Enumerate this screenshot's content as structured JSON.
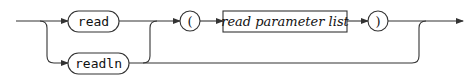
{
  "diagram": {
    "type": "syntax-diagram",
    "terminals": [
      {
        "id": "read",
        "label": "read"
      },
      {
        "id": "readln",
        "label": "readln"
      },
      {
        "id": "lparen",
        "label": "("
      },
      {
        "id": "rparen",
        "label": ")"
      }
    ],
    "nonterminals": [
      {
        "id": "read-parameter-list",
        "label": "read parameter list"
      }
    ],
    "paths": [
      "start → (read | readln)",
      "read | readln → ( → read parameter list → ) → end",
      "read | readln → end (optional parameter list skipped)"
    ]
  }
}
